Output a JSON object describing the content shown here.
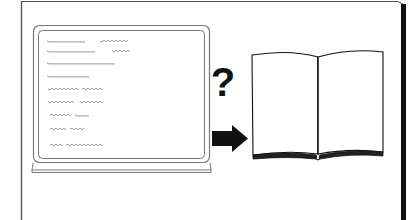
{
  "figure": {
    "question_symbol": "?",
    "colors": {
      "ink": "#111111",
      "frame_line": "#555555",
      "monitor_line": "#777777",
      "scribble": "#9a9a9a",
      "background": "#ffffff"
    },
    "monitor": {
      "text_lines": [
        {
          "y": 41,
          "segments": [
            [
              47,
              85
            ],
            [
              100,
              128
            ]
          ]
        },
        {
          "y": 51,
          "segments": [
            [
              47,
              96
            ],
            [
              112,
              130
            ]
          ]
        },
        {
          "y": 63,
          "segments": [
            [
              47,
              116
            ]
          ]
        },
        {
          "y": 76,
          "segments": [
            [
              47,
              89
            ]
          ]
        },
        {
          "y": 89,
          "segments": [
            [
              48,
              78
            ],
            [
              82,
              103
            ]
          ]
        },
        {
          "y": 102,
          "segments": [
            [
              48,
              75
            ],
            [
              80,
              103
            ]
          ]
        },
        {
          "y": 115,
          "segments": [
            [
              50,
              71
            ],
            [
              75,
              90
            ]
          ]
        },
        {
          "y": 129,
          "segments": [
            [
              50,
              67
            ],
            [
              70,
              85
            ]
          ]
        },
        {
          "y": 145,
          "segments": [
            [
              50,
              62
            ],
            [
              66,
              103
            ]
          ]
        }
      ]
    },
    "arrow": {
      "direction": "right"
    },
    "book": {
      "state": "open",
      "pages": "blank"
    }
  }
}
